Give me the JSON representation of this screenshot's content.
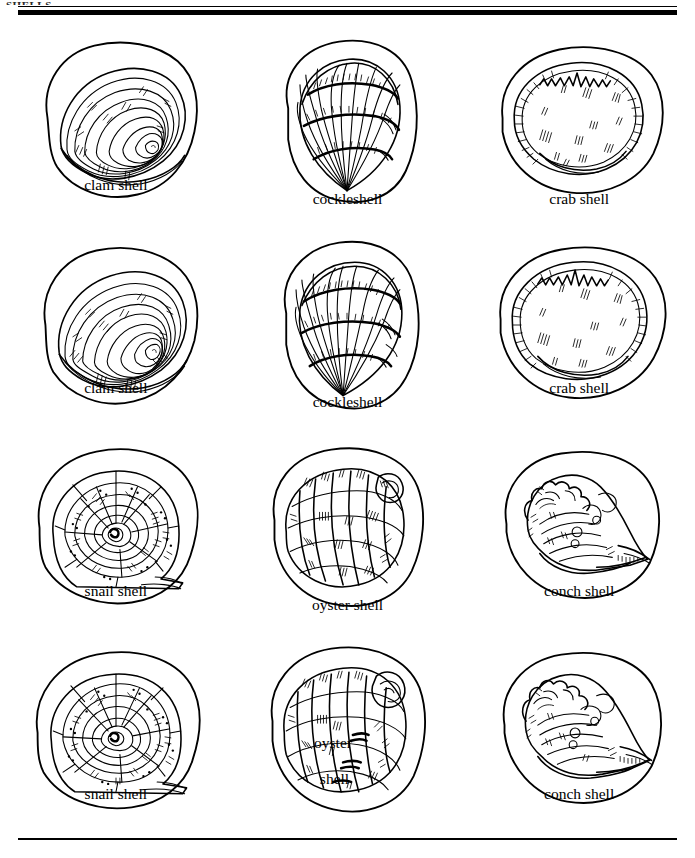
{
  "page": {
    "header_text": "SHELLS",
    "background_color": "#ffffff",
    "ink_color": "#000000",
    "top_rule_thin": true,
    "top_rule_thick": true,
    "bottom_rule": true
  },
  "grid": {
    "columns": 3,
    "rows": 4
  },
  "figures": [
    {
      "id": "clam-shell-1",
      "label": "clam shell",
      "row": 1,
      "col": 1,
      "type": "clam",
      "caption_style": "mid"
    },
    {
      "id": "cockleshell-1",
      "label": "cockleshell",
      "row": 1,
      "col": 2,
      "type": "cockle",
      "caption_style": "low"
    },
    {
      "id": "crab-shell-1",
      "label": "crab shell",
      "row": 1,
      "col": 3,
      "type": "crab",
      "caption_style": "low"
    },
    {
      "id": "clam-shell-2",
      "label": "clam shell",
      "row": 2,
      "col": 1,
      "type": "clam",
      "caption_style": "mid"
    },
    {
      "id": "cockleshell-2",
      "label": "cockleshell",
      "row": 2,
      "col": 2,
      "type": "cockle",
      "caption_style": "low"
    },
    {
      "id": "crab-shell-2",
      "label": "crab shell",
      "row": 2,
      "col": 3,
      "type": "crab",
      "caption_style": "mid"
    },
    {
      "id": "snail-shell-1",
      "label": "snail shell",
      "row": 3,
      "col": 1,
      "type": "snail",
      "caption_style": "mid"
    },
    {
      "id": "oyster-shell-1",
      "label": "oyster shell",
      "row": 3,
      "col": 2,
      "type": "oyster",
      "caption_style": "low"
    },
    {
      "id": "conch-shell-1",
      "label": "conch shell",
      "row": 3,
      "col": 3,
      "type": "conch",
      "caption_style": "mid"
    },
    {
      "id": "snail-shell-2",
      "label": "snail shell",
      "row": 4,
      "col": 1,
      "type": "snail",
      "caption_style": "mid"
    },
    {
      "id": "oyster-shell-2",
      "label_line1": "oyster",
      "label_line2": "shell",
      "row": 4,
      "col": 2,
      "type": "oyster",
      "caption_style": "two"
    },
    {
      "id": "conch-shell-2",
      "label": "conch shell",
      "row": 4,
      "col": 3,
      "type": "conch",
      "caption_style": "mid"
    }
  ]
}
